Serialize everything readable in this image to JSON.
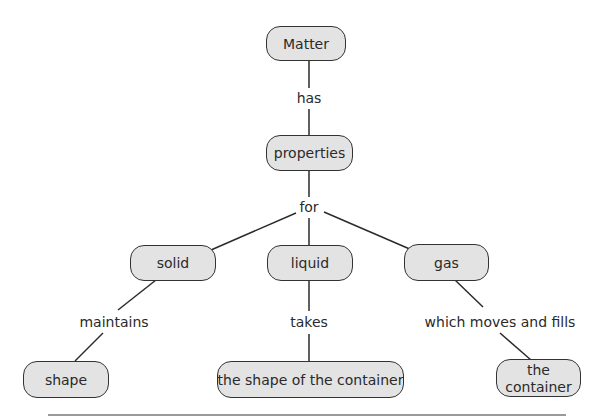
{
  "concept_map": {
    "title": "Matter",
    "nodes": [
      {
        "id": "matter",
        "label": "Matter"
      },
      {
        "id": "properties",
        "label": "properties"
      },
      {
        "id": "solid",
        "label": "solid"
      },
      {
        "id": "liquid",
        "label": "liquid"
      },
      {
        "id": "gas",
        "label": "gas"
      },
      {
        "id": "shape",
        "label": "shape"
      },
      {
        "id": "shape_of_container",
        "label": "the shape of the container"
      },
      {
        "id": "the_container",
        "label": "the container"
      }
    ],
    "links": [
      {
        "from": "matter",
        "to": "properties",
        "label": "has"
      },
      {
        "from": "properties",
        "to": "solid",
        "label": "for"
      },
      {
        "from": "properties",
        "to": "liquid",
        "label": "for"
      },
      {
        "from": "properties",
        "to": "gas",
        "label": "for"
      },
      {
        "from": "solid",
        "to": "shape",
        "label": "maintains"
      },
      {
        "from": "liquid",
        "to": "shape_of_container",
        "label": "takes"
      },
      {
        "from": "gas",
        "to": "the_container",
        "label": "which moves and fills"
      }
    ]
  },
  "labels": {
    "has": "has",
    "for": "for",
    "maintains": "maintains",
    "takes": "takes",
    "which_moves_and_fills": "which moves and fills"
  },
  "colors": {
    "node_fill": "#e3e3e3",
    "node_border": "#333333",
    "line": "#2b2b2b",
    "text": "#2a2a2a"
  }
}
